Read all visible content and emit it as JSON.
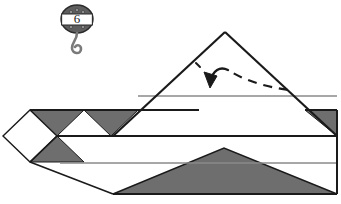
{
  "page": {
    "background_color": "#ffffff"
  },
  "step_badge": {
    "name": "pulley-hook-badge",
    "step_number": "6",
    "body_color": "#5e5e5e",
    "band_color": "#ffffff",
    "hook_color": "#7a7a7a",
    "outline_color": "#2b2b2b",
    "rivets": "4"
  },
  "diagram": {
    "name": "origami-folded-model",
    "paper_front_color": "#ffffff",
    "paper_back_color": "#6e6e6e",
    "outline_color": "#1a1a1a",
    "crease_color": "#8a8a8a"
  },
  "fold_arrow": {
    "name": "valley-fold-arrow",
    "style": "dashed-curved-arrow",
    "color": "#1a1a1a",
    "direction": "right-to-left-downward",
    "dash_pattern": "9 7"
  },
  "shapes": {
    "left_diamond_label": "white diamond tip",
    "upper_zigzag_label": "shaded zigzag triangles",
    "big_triangle_label": "large upper triangular flap",
    "lower_shaded_label": "lower shaded triangle band",
    "right_corner_label": "upper-right shaded corner"
  }
}
